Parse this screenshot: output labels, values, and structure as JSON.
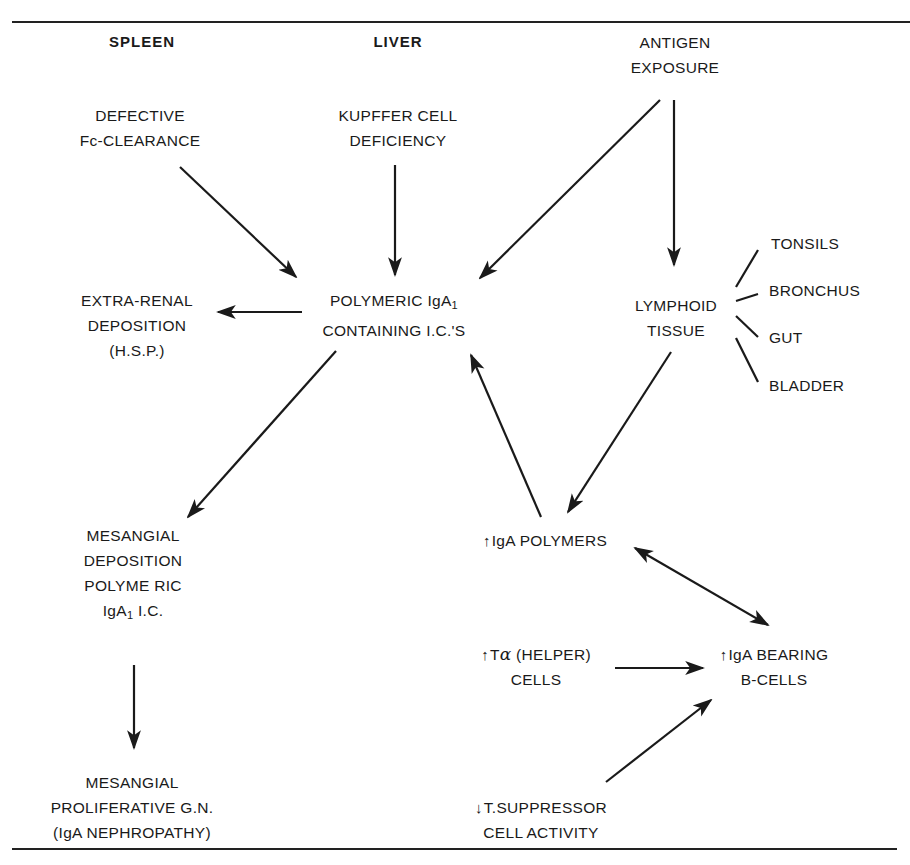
{
  "figure": {
    "headings": {
      "spleen": "SPLEEN",
      "liver": "LIVER"
    },
    "nodes": {
      "antigen_exposure": {
        "lines": [
          "ANTIGEN",
          "EXPOSURE"
        ]
      },
      "defective_fc_clearance": {
        "lines": [
          "DEFECTIVE",
          "Fc-CLEARANCE"
        ]
      },
      "kupffer_cell_deficiency": {
        "lines": [
          "KUPFFER CELL",
          "DEFICIENCY"
        ]
      },
      "polymeric_iga1_ic": {
        "line1_prefix": "POLYMERIC IgA",
        "line1_sub": "1",
        "line2": "CONTAINING I.C.'S"
      },
      "extra_renal_deposition": {
        "lines": [
          "EXTRA-RENAL",
          "DEPOSITION",
          "(H.S.P.)"
        ]
      },
      "lymphoid_tissue": {
        "lines": [
          "LYMPHOID",
          "TISSUE"
        ]
      },
      "lymphoid_sites": [
        "TONSILS",
        "BRONCHUS",
        "GUT",
        "BLADDER"
      ],
      "mesangial_deposition": {
        "line1": "MESANGIAL",
        "line2": "DEPOSITION",
        "line3": "POLYME RIC",
        "line4_prefix": "IgA",
        "line4_sub": "1",
        "line4_suffix": " I.C."
      },
      "mesangial_proliferative_gn": {
        "lines": [
          "MESANGIAL",
          "PROLIFERATIVE G.N.",
          "(IgA NEPHROPATHY)"
        ]
      },
      "iga_polymers": {
        "indicator": "↑",
        "label": "IgA POLYMERS"
      },
      "t_helper_cells": {
        "indicator": "↑",
        "line1_prefix": "T",
        "line1_greek": "α",
        "line1_suffix": " (HELPER)",
        "line2": "CELLS"
      },
      "iga_bearing_b_cells": {
        "indicator": "↑",
        "line1": "IgA BEARING",
        "line2": "B-CELLS"
      },
      "t_suppressor_activity": {
        "indicator": "↓",
        "line1": "T.SUPPRESSOR",
        "line2": "CELL ACTIVITY"
      }
    },
    "edges": [
      {
        "from": "defective_fc_clearance",
        "to": "polymeric_iga1_ic",
        "type": "arrow"
      },
      {
        "from": "kupffer_cell_deficiency",
        "to": "polymeric_iga1_ic",
        "type": "arrow"
      },
      {
        "from": "antigen_exposure",
        "to": "polymeric_iga1_ic",
        "type": "arrow"
      },
      {
        "from": "antigen_exposure",
        "to": "lymphoid_tissue",
        "type": "arrow"
      },
      {
        "from": "polymeric_iga1_ic",
        "to": "extra_renal_deposition",
        "type": "arrow"
      },
      {
        "from": "polymeric_iga1_ic",
        "to": "mesangial_deposition",
        "type": "arrow"
      },
      {
        "from": "lymphoid_tissue",
        "to": "iga_polymers",
        "type": "arrow"
      },
      {
        "from": "iga_polymers",
        "to": "polymeric_iga1_ic",
        "type": "arrow"
      },
      {
        "from": "iga_polymers",
        "to": "iga_bearing_b_cells",
        "type": "bidirectional"
      },
      {
        "from": "t_helper_cells",
        "to": "iga_bearing_b_cells",
        "type": "arrow"
      },
      {
        "from": "t_suppressor_activity",
        "to": "iga_bearing_b_cells",
        "type": "arrow"
      },
      {
        "from": "mesangial_deposition",
        "to": "mesangial_proliferative_gn",
        "type": "arrow"
      },
      {
        "from": "lymphoid_tissue",
        "to": "TONSILS",
        "type": "line"
      },
      {
        "from": "lymphoid_tissue",
        "to": "BRONCHUS",
        "type": "line"
      },
      {
        "from": "lymphoid_tissue",
        "to": "GUT",
        "type": "line"
      },
      {
        "from": "lymphoid_tissue",
        "to": "BLADDER",
        "type": "line"
      }
    ],
    "colors": {
      "ink": "#1a1a1a",
      "background": "#ffffff"
    }
  }
}
